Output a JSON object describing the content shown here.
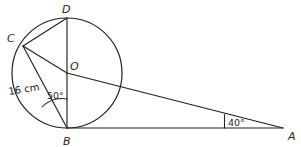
{
  "figure": {
    "background_color": "#ffffff",
    "stroke_color": "#231f20"
  },
  "points": [
    {
      "id": "A",
      "label": "A",
      "label_x": 288,
      "label_y": 140,
      "x": 283,
      "y": 128
    },
    {
      "id": "B",
      "label": "B",
      "label_x": 63,
      "label_y": 145,
      "x": 67,
      "y": 128
    },
    {
      "id": "C",
      "label": "C",
      "label_x": 10,
      "label_y": 41,
      "x": 23,
      "y": 46
    },
    {
      "id": "D",
      "label": "D",
      "label_x": 63,
      "label_y": 12,
      "x": 67,
      "y": 18
    },
    {
      "id": "O",
      "label": "O",
      "label_x": 70,
      "label_y": 70,
      "x": 67,
      "y": 73
    }
  ],
  "circle": {
    "center_x": 67,
    "center_y": 73,
    "radius": 55,
    "label": "circle-outline"
  },
  "segments": [
    {
      "id": "DB",
      "label": "segment-D-B",
      "x1": 67,
      "y1": 18,
      "x2": 67,
      "y2": 128
    },
    {
      "id": "DC",
      "label": "segment-D-C",
      "x1": 67,
      "y1": 18,
      "x2": 23,
      "y2": 46
    },
    {
      "id": "CB",
      "label": "segment-C-B",
      "x1": 23,
      "y1": 46,
      "x2": 67,
      "y2": 128
    },
    {
      "id": "OA",
      "label": "segment-O-A",
      "x1": 67,
      "y1": 73,
      "x2": 283,
      "y2": 128
    },
    {
      "id": "BA",
      "label": "segment-B-A",
      "x1": 67,
      "y1": 128,
      "x2": 283,
      "y2": 128
    },
    {
      "id": "OC_radius",
      "label": "radius-O-C-measure-line",
      "x1": 23,
      "y1": 46,
      "x2": 67,
      "y2": 73
    }
  ],
  "measures": [
    {
      "id": "radius",
      "text": "16 cm",
      "x": 10,
      "y": 94,
      "rotation": -8,
      "name": "radius-measure-label"
    }
  ],
  "angles": [
    {
      "id": "angle-B",
      "text": "50°",
      "value": 50,
      "unit": "degrees",
      "vertex": "B",
      "label_x": 47,
      "label_y": 98,
      "arc_path": "M 44 105 A 27 27 0 0 1 67 101",
      "name": "angle-label-50"
    },
    {
      "id": "angle-A",
      "text": "40°",
      "value": 40,
      "unit": "degrees",
      "vertex": "A",
      "label_x": 230,
      "label_y": 125,
      "arc_path": "M 225 128 L 225 116",
      "name": "angle-label-40"
    }
  ]
}
